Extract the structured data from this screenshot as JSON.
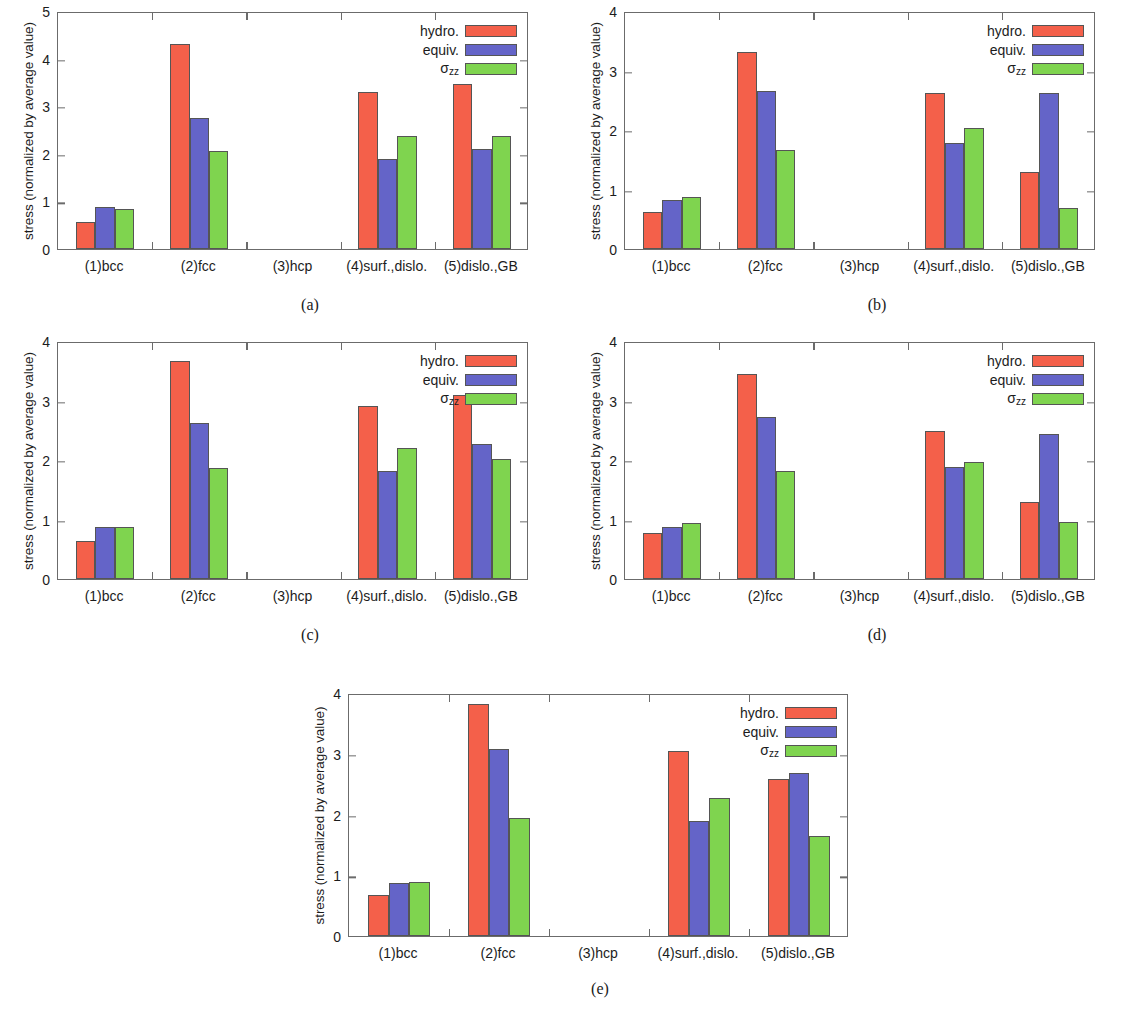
{
  "figure": {
    "background": "#ffffff",
    "series_colors": {
      "hydro": "#f4604a",
      "equiv": "#6464c8",
      "sigma_zz": "#7fd44f"
    },
    "legend_labels": {
      "hydro": "hydro.",
      "equiv": "equiv.",
      "sigma_zz_base": "σ",
      "sigma_zz_sub": "zz"
    },
    "ylabel": "stress (normalized by average value)",
    "captions": {
      "a": "(a)",
      "b": "(b)",
      "c": "(c)",
      "d": "(d)",
      "e": "(e)"
    }
  },
  "chart_data": [
    {
      "id": "a",
      "type": "bar",
      "title": "(a)",
      "xlabel": "",
      "ylabel": "stress (normalized by average value)",
      "ylim": [
        0,
        5
      ],
      "yticks": [
        0,
        1,
        2,
        3,
        4,
        5
      ],
      "grid": false,
      "legend_position": "top-right",
      "categories": [
        "(1)bcc",
        "(2)fcc",
        "(3)hcp",
        "(4)surf.,dislo.",
        "(5)dislo.,GB"
      ],
      "series": [
        {
          "name": "hydro.",
          "color": "#f4604a",
          "values": [
            0.57,
            4.3,
            null,
            3.29,
            3.46
          ]
        },
        {
          "name": "equiv.",
          "color": "#6464c8",
          "values": [
            0.88,
            2.76,
            null,
            1.9,
            2.1
          ]
        },
        {
          "name": "σzz",
          "color": "#7fd44f",
          "values": [
            0.85,
            2.05,
            null,
            2.38,
            2.37
          ]
        }
      ]
    },
    {
      "id": "b",
      "type": "bar",
      "title": "(b)",
      "xlabel": "",
      "ylabel": "stress (normalized by average value)",
      "ylim": [
        0,
        4
      ],
      "yticks": [
        0,
        1,
        2,
        3,
        4
      ],
      "grid": false,
      "legend_position": "top-right",
      "categories": [
        "(1)bcc",
        "(2)fcc",
        "(3)hcp",
        "(4)surf.,dislo.",
        "(5)dislo.,GB"
      ],
      "series": [
        {
          "name": "hydro.",
          "color": "#f4604a",
          "values": [
            0.62,
            3.31,
            null,
            2.63,
            1.29
          ]
        },
        {
          "name": "equiv.",
          "color": "#6464c8",
          "values": [
            0.82,
            2.65,
            null,
            1.79,
            2.62
          ]
        },
        {
          "name": "σzz",
          "color": "#7fd44f",
          "values": [
            0.88,
            1.66,
            null,
            2.04,
            0.69
          ]
        }
      ]
    },
    {
      "id": "c",
      "type": "bar",
      "title": "(c)",
      "xlabel": "",
      "ylabel": "stress (normalized by average value)",
      "ylim": [
        0,
        4
      ],
      "yticks": [
        0,
        1,
        2,
        3,
        4
      ],
      "grid": false,
      "legend_position": "top-right",
      "categories": [
        "(1)bcc",
        "(2)fcc",
        "(3)hcp",
        "(4)surf.,dislo.",
        "(5)dislo.,GB"
      ],
      "series": [
        {
          "name": "hydro.",
          "color": "#f4604a",
          "values": [
            0.64,
            3.66,
            null,
            2.9,
            3.1
          ]
        },
        {
          "name": "equiv.",
          "color": "#6464c8",
          "values": [
            0.88,
            2.62,
            null,
            1.82,
            2.27
          ]
        },
        {
          "name": "σzz",
          "color": "#7fd44f",
          "values": [
            0.88,
            1.86,
            null,
            2.2,
            2.01
          ]
        }
      ]
    },
    {
      "id": "d",
      "type": "bar",
      "title": "(d)",
      "xlabel": "",
      "ylabel": "stress (normalized by average value)",
      "ylim": [
        0,
        4
      ],
      "yticks": [
        0,
        1,
        2,
        3,
        4
      ],
      "grid": false,
      "legend_position": "top-right",
      "categories": [
        "(1)bcc",
        "(2)fcc",
        "(3)hcp",
        "(4)surf.,dislo.",
        "(5)dislo.,GB"
      ],
      "series": [
        {
          "name": "hydro.",
          "color": "#f4604a",
          "values": [
            0.78,
            3.45,
            null,
            2.48,
            1.29
          ]
        },
        {
          "name": "equiv.",
          "color": "#6464c8",
          "values": [
            0.88,
            2.73,
            null,
            1.89,
            2.43
          ]
        },
        {
          "name": "σzz",
          "color": "#7fd44f",
          "values": [
            0.94,
            1.82,
            null,
            1.96,
            0.96
          ]
        }
      ]
    },
    {
      "id": "e",
      "type": "bar",
      "title": "(e)",
      "xlabel": "",
      "ylabel": "stress (normalized by average value)",
      "ylim": [
        0,
        4
      ],
      "yticks": [
        0,
        1,
        2,
        3,
        4
      ],
      "grid": false,
      "legend_position": "top-right",
      "categories": [
        "(1)bcc",
        "(2)fcc",
        "(3)hcp",
        "(4)surf.,dislo.",
        "(5)dislo.,GB"
      ],
      "series": [
        {
          "name": "hydro.",
          "color": "#f4604a",
          "values": [
            0.68,
            3.82,
            null,
            3.04,
            2.59
          ]
        },
        {
          "name": "equiv.",
          "color": "#6464c8",
          "values": [
            0.87,
            3.08,
            null,
            1.9,
            2.69
          ]
        },
        {
          "name": "σzz",
          "color": "#7fd44f",
          "values": [
            0.89,
            1.95,
            null,
            2.27,
            1.64
          ]
        }
      ]
    }
  ],
  "layout": {
    "panels": [
      {
        "id": "a",
        "left": 0,
        "top": 0,
        "width": 567,
        "height": 330,
        "plot": {
          "left": 57,
          "top": 12,
          "width": 471,
          "height": 238
        },
        "caption_x": 310,
        "caption_y": 296
      },
      {
        "id": "b",
        "left": 567,
        "top": 0,
        "width": 567,
        "height": 330,
        "plot": {
          "left": 57,
          "top": 12,
          "width": 471,
          "height": 238
        },
        "caption_x": 310,
        "caption_y": 296
      },
      {
        "id": "c",
        "left": 0,
        "top": 330,
        "width": 567,
        "height": 330,
        "plot": {
          "left": 57,
          "top": 12,
          "width": 471,
          "height": 238
        },
        "caption_x": 310,
        "caption_y": 296
      },
      {
        "id": "d",
        "left": 567,
        "top": 330,
        "width": 567,
        "height": 330,
        "plot": {
          "left": 57,
          "top": 12,
          "width": 471,
          "height": 238
        },
        "caption_x": 310,
        "caption_y": 296
      },
      {
        "id": "e",
        "left": 290,
        "top": 682,
        "width": 567,
        "height": 328,
        "plot": {
          "left": 58,
          "top": 12,
          "width": 500,
          "height": 243
        },
        "caption_x": 310,
        "caption_y": 298
      }
    ]
  }
}
